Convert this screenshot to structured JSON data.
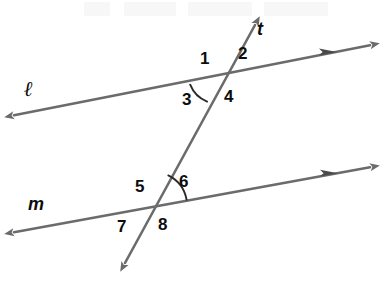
{
  "figure": {
    "width": 380,
    "height": 282,
    "background_color": "#ffffff",
    "line_color": "#6b6b6b",
    "label_color": "#0d0d0d",
    "arc_color": "#2a2a2a",
    "line_width": 2.6
  },
  "lines": {
    "l": {
      "name": "l",
      "label": "ℓ",
      "label_x": 24,
      "label_y": 79,
      "x1": 10,
      "y1": 116,
      "x2": 376,
      "y2": 44,
      "left_arrow": "single",
      "right_arrow": "double"
    },
    "m": {
      "name": "m",
      "label": "m",
      "label_x": 28,
      "label_y": 195,
      "x1": 10,
      "y1": 233,
      "x2": 376,
      "y2": 166,
      "left_arrow": "single",
      "right_arrow": "double"
    },
    "t": {
      "name": "t",
      "label": "t",
      "label_x": 257,
      "label_y": 20,
      "x1": 121,
      "y1": 270,
      "x2": 259,
      "y2": 18,
      "bottom_arrow": "single",
      "top_arrow": "single"
    }
  },
  "intersections": {
    "upper": {
      "x": 219,
      "y": 79,
      "lines": "l-and-t"
    },
    "lower": {
      "x": 153,
      "y": 206,
      "lines": "m-and-t"
    }
  },
  "angles": [
    {
      "id": 1,
      "label": "1",
      "x": 200,
      "y": 50,
      "position": "upper-left-above"
    },
    {
      "id": 2,
      "label": "2",
      "x": 238,
      "y": 45,
      "position": "upper-right-above"
    },
    {
      "id": 3,
      "label": "3",
      "x": 182,
      "y": 91,
      "position": "upper-left-below",
      "has_arc": true
    },
    {
      "id": 4,
      "label": "4",
      "x": 224,
      "y": 88,
      "position": "upper-right-below"
    },
    {
      "id": 5,
      "label": "5",
      "x": 135,
      "y": 178,
      "position": "lower-left-above"
    },
    {
      "id": 6,
      "label": "6",
      "x": 179,
      "y": 173,
      "position": "lower-right-above",
      "has_arc": true
    },
    {
      "id": 7,
      "label": "7",
      "x": 117,
      "y": 218,
      "position": "lower-left-below"
    },
    {
      "id": 8,
      "label": "8",
      "x": 158,
      "y": 216,
      "position": "lower-right-below"
    }
  ],
  "arcs": [
    {
      "for_angle": 3,
      "center_x": 219,
      "center_y": 79,
      "radius": 30,
      "description": "arc-between-line-l-left-and-transversal-down"
    },
    {
      "for_angle": 6,
      "center_x": 153,
      "center_y": 206,
      "radius": 34,
      "description": "arc-between-transversal-up-and-line-m-right"
    }
  ]
}
